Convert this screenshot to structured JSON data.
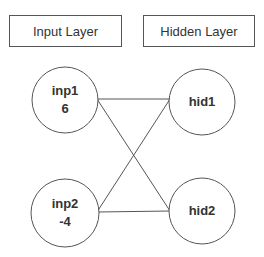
{
  "layers": {
    "input": {
      "label": "Input Layer"
    },
    "hidden": {
      "label": "Hidden Layer"
    }
  },
  "nodes": {
    "inp1": {
      "name": "inp1",
      "value": "6"
    },
    "inp2": {
      "name": "inp2",
      "value": "-4"
    },
    "hid1": {
      "name": "hid1"
    },
    "hid2": {
      "name": "hid2"
    }
  },
  "connections": [
    {
      "from": "inp1",
      "to": "hid1"
    },
    {
      "from": "inp1",
      "to": "hid2"
    },
    {
      "from": "inp2",
      "to": "hid1"
    },
    {
      "from": "inp2",
      "to": "hid2"
    }
  ],
  "colors": {
    "stroke": "#555555",
    "text": "#333333"
  }
}
